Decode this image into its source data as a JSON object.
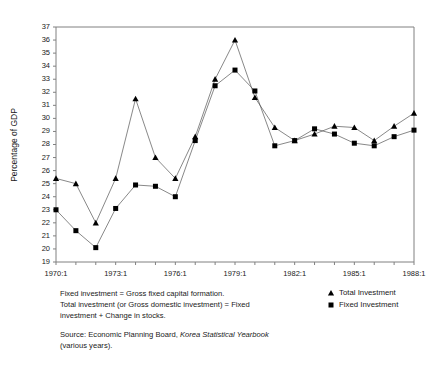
{
  "chart_data": {
    "type": "line",
    "title": "",
    "subtitle": "",
    "xlabel": "",
    "ylabel": "Percentage of GDP",
    "ylim": [
      19,
      37
    ],
    "xlim": [
      1970,
      1988
    ],
    "grid": false,
    "legend_position": "bottom-right",
    "y_ticks": [
      19,
      20,
      21,
      22,
      23,
      24,
      25,
      26,
      27,
      28,
      29,
      30,
      31,
      32,
      33,
      34,
      35,
      36,
      37
    ],
    "x_tick_labels": [
      "1970:1",
      "1973:1",
      "1976:1",
      "1979:1",
      "1982:1",
      "1985:1",
      "1988:1"
    ],
    "x_tick_values": [
      1970,
      1973,
      1976,
      1979,
      1982,
      1985,
      1988
    ],
    "x": [
      1970,
      1971,
      1972,
      1973,
      1974,
      1975,
      1976,
      1977,
      1978,
      1979,
      1980,
      1981,
      1982,
      1983,
      1984,
      1985,
      1986,
      1987,
      1988
    ],
    "series": [
      {
        "name": "Total Investment",
        "marker": "triangle",
        "color": "#000000",
        "values": [
          25.4,
          25.0,
          22.0,
          25.4,
          31.5,
          27.0,
          25.4,
          28.6,
          33.0,
          36.0,
          31.6,
          29.3,
          28.3,
          28.8,
          29.4,
          29.3,
          28.3,
          29.4,
          30.4
        ]
      },
      {
        "name": "Fixed Investment",
        "marker": "square",
        "color": "#000000",
        "values": [
          23.0,
          21.4,
          20.1,
          23.1,
          24.9,
          24.8,
          24.0,
          28.3,
          32.5,
          33.7,
          32.1,
          27.9,
          28.3,
          29.2,
          28.8,
          28.1,
          27.9,
          28.6,
          29.1
        ]
      }
    ]
  },
  "legend": {
    "entries": [
      {
        "label": "Total Investment",
        "marker": "triangle"
      },
      {
        "label": "Fixed Investment",
        "marker": "square"
      }
    ]
  },
  "notes": {
    "line1": "Fixed investment = Gross fixed capital formation.",
    "line2": "Total investment (or Gross domestic investment) = Fixed",
    "line3": "investment + Change in stocks.",
    "source_prefix": "Source: Economic Planning Board, ",
    "source_italic": "Korea Statistical Yearbook",
    "source_suffix": "(various years)."
  }
}
